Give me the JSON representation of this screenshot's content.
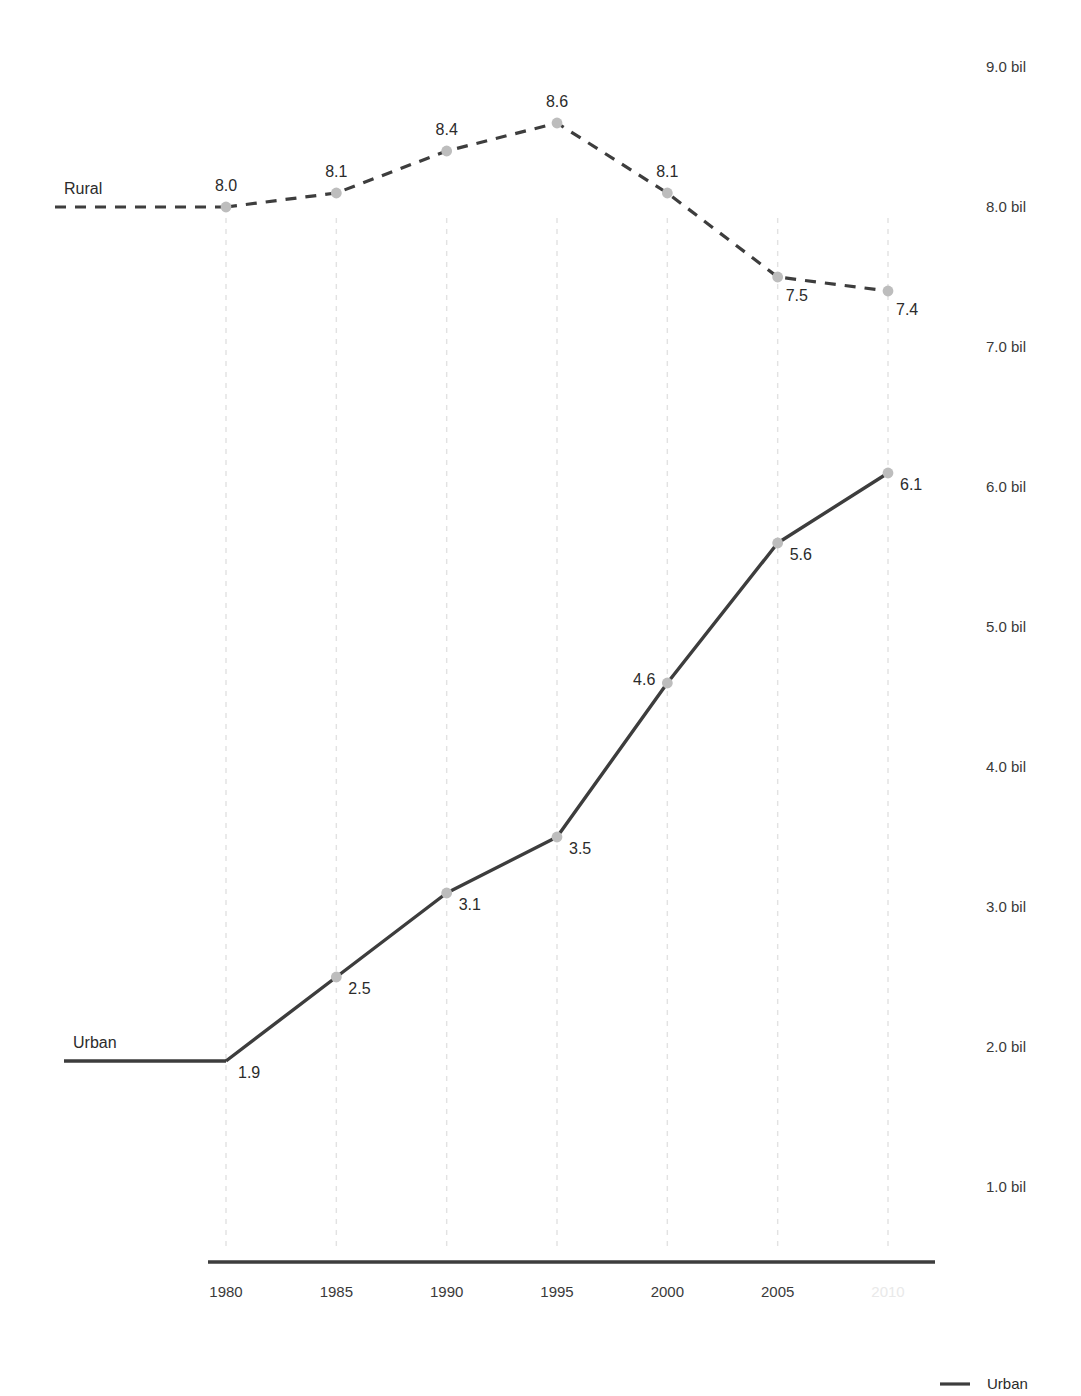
{
  "chart_data": {
    "type": "line",
    "title": "",
    "subtitle": "",
    "xlabel": "",
    "ylabel": "",
    "x": [
      1980,
      1985,
      1990,
      1995,
      2000,
      2005,
      2010
    ],
    "categories": [
      "1980",
      "1985",
      "1990",
      "1995",
      "2000",
      "2005",
      "2010"
    ],
    "xtick_labels": [
      "1980",
      "1985",
      "1990",
      "1995",
      "2000",
      "2005",
      "2010"
    ],
    "xtick_muted": [
      false,
      false,
      false,
      false,
      false,
      false,
      true
    ],
    "ytick_labels": [
      "1.0 bil",
      "2.0 bil",
      "3.0 bil",
      "4.0 bil",
      "5.0 bil",
      "6.0 bil",
      "7.0 bil",
      "8.0 bil",
      "9.0 bil"
    ],
    "ytick_values": [
      1.0,
      2.0,
      3.0,
      4.0,
      5.0,
      6.0,
      7.0,
      8.0,
      9.0
    ],
    "ylim": [
      0.5,
      9.4
    ],
    "xlim": [
      1978.2,
      2011.2
    ],
    "grid": "vertical-dashed",
    "legend_position": "bottom-right",
    "series": [
      {
        "name": "Rural",
        "style": "dashed",
        "color": "#3d3d3d",
        "marker_color": "#bdbdbd",
        "label_position": "left-above",
        "values": [
          8.0,
          8.1,
          8.4,
          8.6,
          8.1,
          7.5,
          7.4
        ],
        "point_labels": [
          "8.0",
          "8.1",
          "8.4",
          "8.6",
          "8.1",
          "7.5",
          "7.4"
        ],
        "label_anchor": [
          "above",
          "above",
          "above",
          "above",
          "above",
          "below-right",
          "below-right"
        ]
      },
      {
        "name": "Urban",
        "style": "solid",
        "color": "#3d3d3d",
        "marker_color": "#bdbdbd",
        "label_position": "left-above",
        "values": [
          1.9,
          2.5,
          3.1,
          3.5,
          4.6,
          5.6,
          6.1
        ],
        "point_labels": [
          "1.9",
          "2.5",
          "3.1",
          "3.5",
          "4.6",
          "5.6",
          "6.1"
        ],
        "label_anchor": [
          "right",
          "right",
          "right",
          "right",
          "left",
          "right",
          "right"
        ]
      }
    ],
    "legend": [
      {
        "name": "Urban",
        "style": "solid",
        "color": "#3d3d3d"
      }
    ],
    "colors": {
      "line": "#3d3d3d",
      "marker": "#bdbdbd",
      "gridline": "#e2e2e2",
      "axis": "#3d3d3d",
      "text": "#2b2b2b",
      "muted_text": "#e9e9e9",
      "background": "#ffffff"
    }
  },
  "layout": {
    "plot_left": 226,
    "plot_right": 888,
    "axis_line_x1": 208,
    "axis_line_x2": 935,
    "axis_line_y": 1262,
    "grid_top": 218,
    "grid_bottom": 1250,
    "y_for_value_1": 1187,
    "px_per_unit": 140,
    "lead_in_rural_x": 55,
    "lead_in_urban_x": 64,
    "ytick_label_x": 986,
    "xtick_label_y": 1297,
    "legend_x": 940,
    "legend_y": 1384
  }
}
